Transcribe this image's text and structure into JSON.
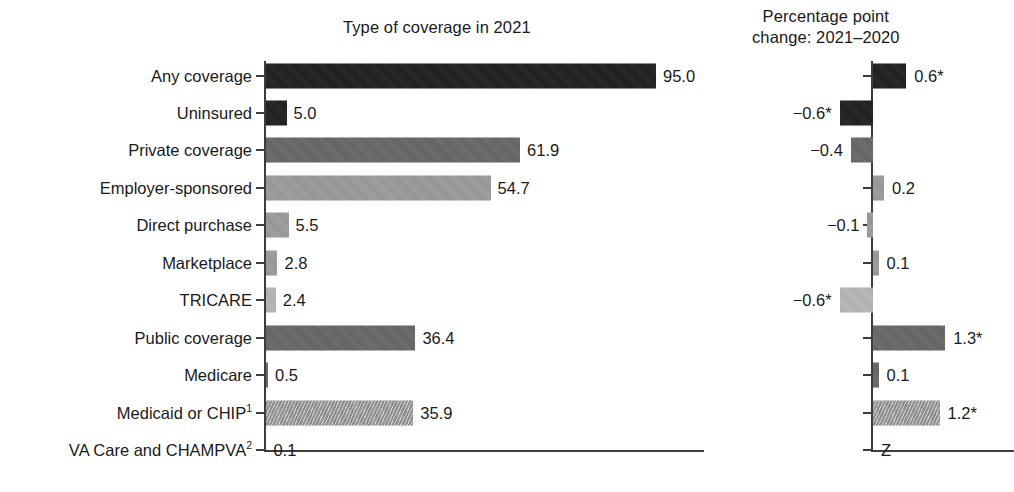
{
  "left_panel": {
    "title": "Type of coverage in 2021"
  },
  "right_panel": {
    "title_line1": "Percentage point",
    "title_line2": "change: 2021–2020",
    "zero_marker": "Z"
  },
  "chart_data": {
    "type": "bar",
    "title": "Type of coverage in 2021",
    "orientation": "horizontal",
    "panels": [
      {
        "name": "coverage",
        "title": "Type of coverage in 2021",
        "xlabel": "",
        "ylabel": "",
        "xlim": [
          0,
          100
        ],
        "grid": false
      },
      {
        "name": "change",
        "title": "Percentage point change: 2021–2020",
        "xlabel": "",
        "ylabel": "",
        "xlim": [
          -1.0,
          1.6
        ],
        "grid": false,
        "zero_marker": "Z"
      }
    ],
    "categories": [
      "Any coverage",
      "Uninsured",
      "Private coverage",
      "Employer-sponsored",
      "Direct purchase",
      "Marketplace",
      "TRICARE",
      "Public coverage",
      "Medicare",
      "Medicaid or CHIP",
      "VA Care and CHAMPVA"
    ],
    "category_footnotes": [
      "",
      "",
      "",
      "",
      "",
      "",
      "",
      "",
      "",
      "1",
      "2"
    ],
    "series": [
      {
        "name": "Type of coverage in 2021",
        "values": [
          95.0,
          5.0,
          61.9,
          54.7,
          5.5,
          2.8,
          2.4,
          36.4,
          0.5,
          35.9,
          0.1
        ],
        "labels": [
          "95.0",
          "5.0",
          "61.9",
          "54.7",
          "5.5",
          "2.8",
          "2.4",
          "36.4",
          "0.5",
          "35.9",
          "0.1"
        ]
      },
      {
        "name": "Percentage point change: 2021–2020",
        "values": [
          0.6,
          -0.6,
          -0.4,
          0.2,
          -0.1,
          0.1,
          -0.6,
          1.3,
          0.1,
          1.2,
          0.0
        ],
        "labels": [
          "0.6*",
          "−0.6*",
          "−0.4",
          "0.2",
          "−0.1",
          "0.1",
          "−0.6*",
          "1.3*",
          "0.1",
          "1.2*",
          "Z"
        ],
        "significant": [
          true,
          true,
          false,
          false,
          false,
          false,
          true,
          true,
          false,
          true,
          false
        ]
      }
    ],
    "fills": [
      "black",
      "black",
      "darkgray",
      "midgray",
      "midgray",
      "midgray",
      "litegray",
      "darkgray",
      "darkgray",
      "hatch",
      "none"
    ],
    "colors": {
      "black": "#1d1d1d",
      "darkgray": "#666666",
      "midgray": "#9a9a9a",
      "litegray": "#b5b5b5",
      "hatch": "#8f8f8f",
      "axis": "#3d3d3d",
      "text": "#1a1a1a",
      "background": "#ffffff"
    }
  }
}
